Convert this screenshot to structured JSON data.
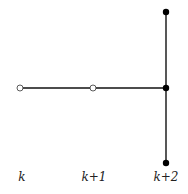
{
  "diagram": {
    "nodes": [
      {
        "id": "a",
        "x": 20,
        "y": 88,
        "style": "open"
      },
      {
        "id": "b",
        "x": 93,
        "y": 88,
        "style": "open"
      },
      {
        "id": "c",
        "x": 166,
        "y": 88,
        "style": "filled"
      },
      {
        "id": "d",
        "x": 166,
        "y": 12,
        "style": "filled"
      },
      {
        "id": "e",
        "x": 166,
        "y": 163,
        "style": "filled"
      }
    ],
    "edges": [
      {
        "from": "a",
        "to": "b"
      },
      {
        "from": "b",
        "to": "c"
      },
      {
        "from": "d",
        "to": "c"
      },
      {
        "from": "c",
        "to": "e"
      }
    ],
    "labels": [
      {
        "text": "k",
        "x": 22
      },
      {
        "text": "k+1",
        "x": 94
      },
      {
        "text": "k+2",
        "x": 166
      }
    ],
    "colors": {
      "line": "#111111",
      "node_fill": "#000000",
      "open_stroke": "#333333"
    }
  }
}
